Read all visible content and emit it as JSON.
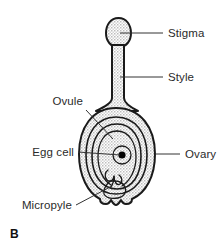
{
  "figure": {
    "panel_letter": "B"
  },
  "colors": {
    "outline": "#1a1a1a",
    "leader_line": "#333333",
    "label_text": "#2b2b2b",
    "stipple_fill": "#c9c9c9",
    "background": "#ffffff",
    "nucleus": "#000000"
  },
  "labels": {
    "stigma": "Stigma",
    "style": "Style",
    "ovary": "Ovary",
    "ovule": "Ovule",
    "egg_cell": "Egg cell",
    "micropyle": "Micropyle"
  },
  "parts": [
    {
      "id": "stigma",
      "name": "Stigma",
      "side": "right"
    },
    {
      "id": "style",
      "name": "Style",
      "side": "right"
    },
    {
      "id": "ovary",
      "name": "Ovary",
      "side": "right"
    },
    {
      "id": "ovule",
      "name": "Ovule",
      "side": "left"
    },
    {
      "id": "egg_cell",
      "name": "Egg cell",
      "side": "left"
    },
    {
      "id": "micropyle",
      "name": "Micropyle",
      "side": "left"
    }
  ]
}
